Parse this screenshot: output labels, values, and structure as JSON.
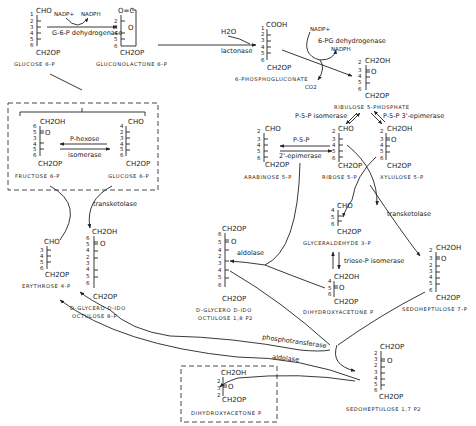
{
  "diagram": {
    "compounds": {
      "glucose6p_top": {
        "name": "GLUCOSE 6-P",
        "top": "CHO",
        "bottom": "CH2OP",
        "carbons": [
          "1",
          "2",
          "3",
          "4",
          "5",
          "6"
        ]
      },
      "gluconolactone": {
        "name": "GLUCONOLACTONE 6-P",
        "top": "O=C",
        "ring": "O",
        "bottom": "CH2OP",
        "carbons": [
          "1",
          "2",
          "3",
          "4",
          "5",
          "6"
        ]
      },
      "phosphogluconate": {
        "name": "6-PHOSPHOGLUCONATE",
        "top": "COOH",
        "bottom": "CH2OP",
        "carbons": [
          "1",
          "2",
          "3",
          "4",
          "5",
          "6"
        ]
      },
      "ribulose5p": {
        "name": "RIBULOSE 5-PHOSPHATE",
        "top": "CH2OH",
        "keto": "O",
        "bottom": "CH2OP",
        "carbons": [
          "2",
          "3",
          "4",
          "5",
          "6"
        ]
      },
      "fructose6p": {
        "name": "FRUCTOSE 6-P",
        "top": "CH2OH",
        "keto": "O",
        "bottom": "CH2OP",
        "carbons": [
          "6",
          "5",
          "3",
          "4",
          "5",
          "6"
        ]
      },
      "glucose6p_box": {
        "name": "GLUCOSE 6-P",
        "top": "CHO",
        "bottom": "CH2OP",
        "carbons": [
          "4",
          "2",
          "3",
          "4",
          "5",
          "6"
        ]
      },
      "arabinose5p": {
        "name": "ARABINOSE 5-P",
        "top": "CHO",
        "bottom": "CH2OP",
        "carbons": [
          "2",
          "3",
          "4",
          "5",
          "6"
        ]
      },
      "ribose5p": {
        "name": "RIBOSE 5-P",
        "top": "CHO",
        "bottom": "CH2OP",
        "carbons": [
          "2",
          "3",
          "4",
          "5",
          "6"
        ]
      },
      "xylulose5p": {
        "name": "XYLULOSE 5-P",
        "top": "CH2OH",
        "keto": "O",
        "bottom": "CH2OP",
        "carbons": [
          "2",
          "3",
          "4",
          "5",
          "6"
        ]
      },
      "glyceraldehyde3p": {
        "name": "GLYCERALDEHYDE 3-P",
        "top": "CHO",
        "bottom": "CH2OP",
        "carbons": [
          "4",
          "5",
          "6"
        ]
      },
      "dhap_mid": {
        "name": "DIHYDROXYACETONE P",
        "top": "CH2OH",
        "keto": "O",
        "bottom": "CH2OP",
        "carbons": [
          "4",
          "5",
          "6"
        ]
      },
      "sedoheptulose7p": {
        "name": "SEDOHEPTULOSE 7-P",
        "top": "CH2OH",
        "keto": "O",
        "bottom": "CH2OP",
        "carbons": [
          "2",
          "3",
          "2",
          "3",
          "4",
          "5",
          "6"
        ]
      },
      "erythrose4p": {
        "name": "ERYTHROSE 4-P",
        "top": "CHO",
        "bottom": "CH2OP",
        "carbons": [
          "3",
          "4",
          "5",
          "6"
        ]
      },
      "octulose8p": {
        "name_line1": "D-GLYCERO D-IDO",
        "name_line2": "OCTULOSE 8-P",
        "top": "CH2OH",
        "keto": "O",
        "bottom": "CH2OP",
        "carbons": [
          "6",
          "5",
          "4",
          "2",
          "3",
          "4",
          "5",
          "6"
        ]
      },
      "octulose18p2": {
        "name_line1": "D-GLYCERO D-IDO",
        "name_line2": "OCTULOSE 1,8 P2",
        "top": "CH2OP",
        "keto": "O",
        "bottom": "CH2OP",
        "carbons": [
          "6",
          "5",
          "4",
          "2",
          "3",
          "4",
          "5",
          "6"
        ]
      },
      "sedoheptulose17p2": {
        "name": "SEDOHEPTULOSE 1,7 P2",
        "top": "CH2OP",
        "keto": "O",
        "bottom": "CH2OP",
        "carbons": [
          "2",
          "3",
          "2",
          "3",
          "4",
          "5",
          "6"
        ]
      },
      "dhap_box": {
        "name": "DIHYDROXYACETONE P",
        "top": "CH2OH",
        "keto": "O",
        "bottom": "CH2OP",
        "carbons": [
          "2",
          "3",
          "2"
        ]
      }
    },
    "cofactors": {
      "nadp_1": "NADP+",
      "nadph_1": "NADPH",
      "h2o": "H2O",
      "nadp_2": "NADP+",
      "nadph_2": "NADPH",
      "co2": "CO2"
    },
    "enzymes": {
      "g6pdh": "G-6-P dehydrogenase",
      "lactonase": "lactonase",
      "pgdh": "6-PG dehydrogenase",
      "p5p_isomerase": "P-5-P isomerase",
      "p5p_3epimerase": "P-5-P 3'-epimerase",
      "p5p_2epimerase_line1": "P-5-P",
      "p5p_2epimerase_line2": "2'-epimerase",
      "phexose_line1": "P-hexose",
      "phexose_line2": "isomerase",
      "transketolase_left": "transketolase",
      "transketolase_right": "transketolase",
      "aldolase_mid": "aldolase",
      "triose_isomerase": "triose-P isomerase",
      "phosphotransferase": "phosphotransferase",
      "aldolase_bottom": "aldolase"
    },
    "colors": {
      "ink": "#222222",
      "background": "#ffffff"
    }
  }
}
